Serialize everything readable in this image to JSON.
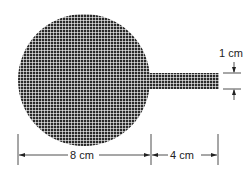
{
  "diagram": {
    "shape": "circle-with-rectangular-handle",
    "fill_pattern": "crosshatch-grid",
    "colors": {
      "fill": "#2a2a2a",
      "grid_line": "#ffffff",
      "dimension": "#222222"
    },
    "labels": {
      "circle_diameter": "8 cm",
      "handle_length": "4 cm",
      "handle_width": "1 cm"
    }
  }
}
